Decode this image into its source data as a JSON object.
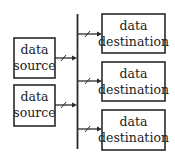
{
  "diagram": {
    "type": "bus-architecture",
    "sources": [
      {
        "line1": "data",
        "line2": "source"
      },
      {
        "line1": "data",
        "line2": "source"
      }
    ],
    "destinations": [
      {
        "line1": "data",
        "line2": "destination"
      },
      {
        "line1": "data",
        "line2": "destination"
      },
      {
        "line1": "data",
        "line2": "destination"
      }
    ],
    "colors": {
      "stroke": "#2a2a2a",
      "text": "#222222",
      "background": "#ffffff"
    }
  }
}
